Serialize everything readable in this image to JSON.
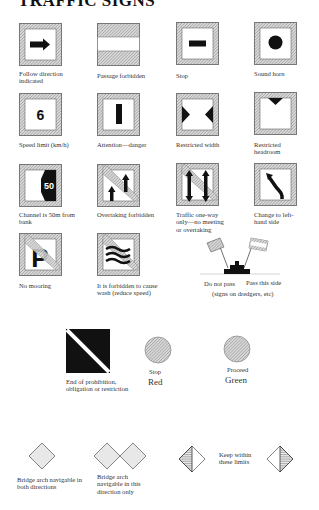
{
  "page": {
    "title": "TRAFFIC SIGNS"
  },
  "signs": [
    {
      "id": "follow-direction",
      "label": "Follow direction indicated",
      "icon": "arrow-right-icon"
    },
    {
      "id": "passage-forbidden",
      "label": "Passage forbidden",
      "icon": "bands-icon"
    },
    {
      "id": "stop",
      "label": "Stop",
      "icon": "dash-icon"
    },
    {
      "id": "sound-horn",
      "label": "Sound horn",
      "icon": "dot-icon"
    },
    {
      "id": "speed-limit",
      "label": "Speed limit (km/h)",
      "icon": "number-icon",
      "value": "6"
    },
    {
      "id": "attention-danger",
      "label": "Attention—danger",
      "icon": "vertical-bar-icon"
    },
    {
      "id": "restricted-width",
      "label": "Restricted width",
      "icon": "opposing-triangles-icon"
    },
    {
      "id": "restricted-headroom",
      "label": "Restricted headroom",
      "icon": "down-triangle-icon"
    },
    {
      "id": "channel-from-bank",
      "label": "Channel is 50m from bank",
      "icon": "bank-distance-icon",
      "value": "50"
    },
    {
      "id": "overtaking-forbidden",
      "label": "Overtaking forbidden",
      "icon": "two-up-arrows-icon"
    },
    {
      "id": "one-way-traffic",
      "label": "Traffic one-way only—no meeting or overtaking",
      "icon": "two-way-arrows-icon"
    },
    {
      "id": "change-left",
      "label": "Change to left-hand side",
      "icon": "curved-arrow-icon"
    },
    {
      "id": "no-mooring",
      "label": "No mooring",
      "icon": "parking-p-icon",
      "value": "P"
    },
    {
      "id": "no-wash",
      "label": "It is forbidden to cause wash (reduce speed)",
      "icon": "waves-icon"
    }
  ],
  "dredger": {
    "left_label": "Do not pass",
    "right_label": "Pass this side",
    "note": "(signs on dredgers, etc)"
  },
  "end_prohibition": {
    "label": "End of prohibition, obligation or restriction"
  },
  "lights": [
    {
      "id": "stop-light",
      "small_label": "Stop",
      "color_label": "Red"
    },
    {
      "id": "proceed-light",
      "small_label": "Proceed",
      "color_label": "Green"
    }
  ],
  "bridge": [
    {
      "id": "bridge-both",
      "label": "Bridge arch navigable in both directions"
    },
    {
      "id": "bridge-this",
      "label": "Bridge arch navigable in this direction only"
    },
    {
      "id": "keep-within",
      "label": "Keep within these limits"
    }
  ]
}
